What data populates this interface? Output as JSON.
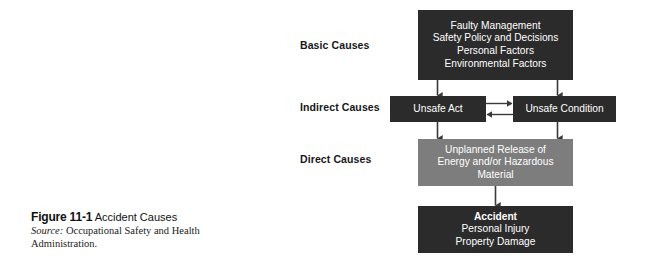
{
  "figure": {
    "rows": [
      {
        "id": "basic",
        "label": "Basic Causes"
      },
      {
        "id": "indirect",
        "label": "Indirect Causes"
      },
      {
        "id": "direct",
        "label": "Direct Causes"
      }
    ],
    "nodes": {
      "basic_causes": {
        "lines": [
          "Faulty Management",
          "Safety Policy and Decisions",
          "Personal Factors",
          "Environmental Factors"
        ],
        "fill": "#2b2b2b",
        "text_color": "#ffffff"
      },
      "unsafe_act": {
        "lines": [
          "Unsafe Act"
        ],
        "fill": "#2b2b2b",
        "text_color": "#ffffff"
      },
      "unsafe_condition": {
        "lines": [
          "Unsafe Condition"
        ],
        "fill": "#2b2b2b",
        "text_color": "#ffffff"
      },
      "direct_causes": {
        "lines": [
          "Unplanned Release of",
          "Energy and/or Hazardous",
          "Material"
        ],
        "fill": "#7d7d7d",
        "text_color": "#ffffff"
      },
      "accident": {
        "heading": "Accident",
        "lines": [
          "Personal Injury",
          "Property Damage"
        ],
        "fill": "#2b2b2b",
        "text_color": "#ffffff"
      }
    },
    "connector_color": "#3a3a3a"
  },
  "caption": {
    "figure_number": "Figure 11-1",
    "figure_title": "Accident Causes",
    "source_label": "Source:",
    "source_text": "Occupational Safety and Health Administration."
  }
}
